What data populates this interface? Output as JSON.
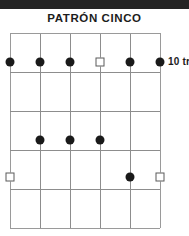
{
  "diagram": {
    "title": "PATRÓN CINCO",
    "type": "guitar-scale-pattern-diagram",
    "colors": {
      "grid": "#8d8d8d",
      "filled_marker": "#1a1a1a",
      "open_marker_border": "#5a5a5a",
      "text": "#1c1c1c",
      "top_band": "#242424",
      "background": "#ffffff"
    },
    "fret_label": {
      "text": "10 tr",
      "fret_number": "10",
      "suffix": "tr"
    },
    "grid": {
      "strings": 6,
      "fret_lines": 6,
      "fret_spaces": 5,
      "string_x": [
        0,
        30,
        60,
        90,
        120,
        150
      ],
      "fret_y": [
        0,
        39,
        78,
        117,
        156,
        195
      ]
    },
    "markers": [
      {
        "name": "marker-f1-s1",
        "fret_space": 1,
        "string": 1,
        "x": 0,
        "y": 29,
        "style": "filled"
      },
      {
        "name": "marker-f1-s2",
        "fret_space": 1,
        "string": 2,
        "x": 30,
        "y": 29,
        "style": "filled"
      },
      {
        "name": "marker-f1-s3",
        "fret_space": 1,
        "string": 3,
        "x": 60,
        "y": 29,
        "style": "filled"
      },
      {
        "name": "marker-f1-s4",
        "fret_space": 1,
        "string": 4,
        "x": 90,
        "y": 29,
        "style": "open"
      },
      {
        "name": "marker-f1-s5",
        "fret_space": 1,
        "string": 5,
        "x": 120,
        "y": 29,
        "style": "filled"
      },
      {
        "name": "marker-f1-s6",
        "fret_space": 1,
        "string": 6,
        "x": 150,
        "y": 29,
        "style": "filled"
      },
      {
        "name": "marker-f3-s2",
        "fret_space": 3,
        "string": 2,
        "x": 30,
        "y": 107,
        "style": "filled"
      },
      {
        "name": "marker-f3-s3",
        "fret_space": 3,
        "string": 3,
        "x": 60,
        "y": 107,
        "style": "filled"
      },
      {
        "name": "marker-f3-s4",
        "fret_space": 3,
        "string": 4,
        "x": 90,
        "y": 107,
        "style": "filled"
      },
      {
        "name": "marker-f4-s1",
        "fret_space": 4,
        "string": 1,
        "x": 0,
        "y": 144,
        "style": "open"
      },
      {
        "name": "marker-f4-s5",
        "fret_space": 4,
        "string": 5,
        "x": 120,
        "y": 144,
        "style": "filled"
      },
      {
        "name": "marker-f4-s6",
        "fret_space": 4,
        "string": 6,
        "x": 150,
        "y": 144,
        "style": "open"
      }
    ]
  }
}
